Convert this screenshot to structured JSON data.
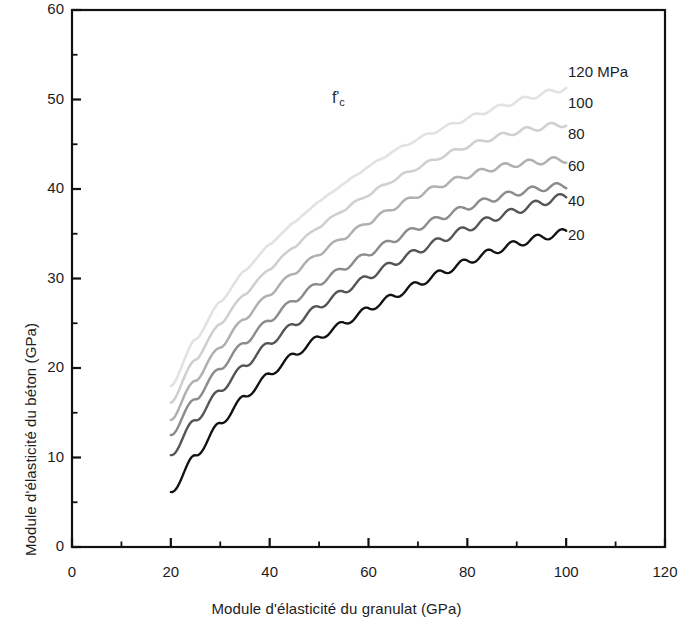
{
  "chart_data": {
    "type": "line",
    "title": "",
    "xlabel": "Module d'élasticité du granulat (GPa)",
    "ylabel": "Module d'élasticité du béton (GPa)",
    "xlim": [
      0,
      120
    ],
    "ylim": [
      0,
      60
    ],
    "xticks": [
      0,
      20,
      40,
      60,
      80,
      100,
      120
    ],
    "yticks": [
      0,
      10,
      20,
      30,
      40,
      50,
      60
    ],
    "xminor_step": 10,
    "yminor_step": 5,
    "grid": false,
    "legend_position": "right-inside",
    "annotation": {
      "text": "f'c",
      "base": "f",
      "prime": "'",
      "subscript": "c",
      "x": 55,
      "y": 49
    },
    "series": [
      {
        "name": "120 MPa",
        "legend_label": "120 MPa",
        "color": "#e2e2e2",
        "x": [
          20,
          25,
          30,
          35,
          40,
          45,
          50,
          55,
          60,
          65,
          70,
          75,
          80,
          85,
          90,
          95,
          100
        ],
        "values": [
          18.0,
          23.2,
          27.4,
          30.9,
          33.8,
          36.3,
          38.6,
          40.6,
          42.5,
          44.2,
          45.6,
          46.8,
          47.9,
          48.9,
          49.8,
          50.6,
          51.3
        ]
      },
      {
        "name": "100 MPa",
        "legend_label": "100",
        "color": "#cfcfcf",
        "x": [
          20,
          25,
          30,
          35,
          40,
          45,
          50,
          55,
          60,
          65,
          70,
          75,
          80,
          85,
          90,
          95,
          100
        ],
        "values": [
          16.2,
          21.0,
          25.0,
          28.3,
          31.1,
          33.6,
          35.8,
          37.7,
          39.4,
          41.0,
          42.4,
          43.7,
          44.8,
          45.7,
          46.4,
          46.9,
          47.3
        ]
      },
      {
        "name": "80 MPa",
        "legend_label": "80",
        "color": "#b0b0b0",
        "x": [
          20,
          25,
          30,
          35,
          40,
          45,
          50,
          55,
          60,
          65,
          70,
          75,
          80,
          85,
          90,
          95,
          100
        ],
        "values": [
          14.3,
          18.7,
          22.4,
          25.6,
          28.3,
          30.7,
          32.8,
          34.6,
          36.3,
          37.9,
          39.3,
          40.5,
          41.5,
          42.3,
          42.8,
          43.1,
          43.3
        ]
      },
      {
        "name": "60 MPa",
        "legend_label": "60",
        "color": "#8c8c8c",
        "x": [
          20,
          25,
          30,
          35,
          40,
          45,
          50,
          55,
          60,
          65,
          70,
          75,
          80,
          85,
          90,
          95,
          100
        ],
        "values": [
          12.6,
          16.6,
          20.0,
          22.9,
          25.4,
          27.6,
          29.5,
          31.2,
          32.8,
          34.3,
          35.7,
          36.9,
          38.0,
          38.9,
          39.6,
          40.1,
          40.4
        ]
      },
      {
        "name": "40 MPa",
        "legend_label": "40",
        "color": "#555555",
        "x": [
          20,
          25,
          30,
          35,
          40,
          45,
          50,
          55,
          60,
          65,
          70,
          75,
          80,
          85,
          90,
          95,
          100
        ],
        "values": [
          10.3,
          14.2,
          17.5,
          20.3,
          22.8,
          24.9,
          26.9,
          28.6,
          30.2,
          31.7,
          33.1,
          34.4,
          35.6,
          36.7,
          37.6,
          38.5,
          39.2
        ]
      },
      {
        "name": "20 MPa",
        "legend_label": "20",
        "color": "#121212",
        "x": [
          20,
          25,
          30,
          35,
          40,
          45,
          50,
          55,
          60,
          65,
          70,
          75,
          80,
          85,
          90,
          95,
          100
        ],
        "values": [
          6.1,
          10.2,
          13.8,
          16.8,
          19.3,
          21.5,
          23.4,
          25.0,
          26.6,
          28.0,
          29.4,
          30.7,
          31.9,
          33.0,
          33.9,
          34.6,
          35.2
        ]
      }
    ],
    "legend_entries": [
      {
        "label": "120 MPa",
        "y_value": 53.0
      },
      {
        "label": "100",
        "y_value": 49.5
      },
      {
        "label": "80",
        "y_value": 46.0
      },
      {
        "label": "60",
        "y_value": 42.5
      },
      {
        "label": "40",
        "y_value": 38.6
      },
      {
        "label": "20",
        "y_value": 34.8
      }
    ]
  }
}
